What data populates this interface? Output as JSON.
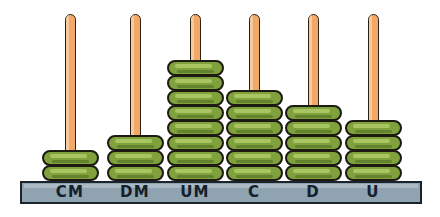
{
  "figure": {
    "total_value": "238654",
    "colors": {
      "rod": "#F2A968",
      "rod_outline": "#2b2117",
      "bead": "#7FA23C",
      "bead_outline": "#1d1a12",
      "base": "#8FA3B0",
      "base_outline": "#1d232b",
      "background": "#ffffff",
      "label_text": "#14202b"
    }
  },
  "chart_data": {
    "type": "bar",
    "xlabel": "",
    "ylabel": "Number of beads",
    "categories": [
      "CM",
      "DM",
      "UM",
      "C",
      "D",
      "U"
    ],
    "values": [
      2,
      3,
      8,
      6,
      5,
      4
    ],
    "ylim": [
      0,
      8
    ],
    "grid": false,
    "legend": null,
    "series": [
      {
        "name": "beads",
        "values": [
          2,
          3,
          8,
          6,
          5,
          4
        ]
      }
    ],
    "annotations": [
      "CM = centenas de millar",
      "DM = decenas de millar",
      "UM = unidades de millar",
      "C = centenas",
      "D = decenas",
      "U = unidades"
    ]
  },
  "rods": [
    {
      "label": "CM",
      "beads": 2,
      "center_x": 70,
      "rod_top": 14,
      "rod_height": 152
    },
    {
      "label": "DM",
      "beads": 3,
      "center_x": 135,
      "rod_top": 14,
      "rod_height": 136
    },
    {
      "label": "UM",
      "beads": 8,
      "center_x": 195,
      "rod_top": 14,
      "rod_height": 66
    },
    {
      "label": "C",
      "beads": 6,
      "center_x": 254,
      "rod_top": 14,
      "rod_height": 96
    },
    {
      "label": "D",
      "beads": 5,
      "center_x": 313,
      "rod_top": 14,
      "rod_height": 112
    },
    {
      "label": "U",
      "beads": 4,
      "center_x": 373,
      "rod_top": 14,
      "rod_height": 128
    }
  ]
}
